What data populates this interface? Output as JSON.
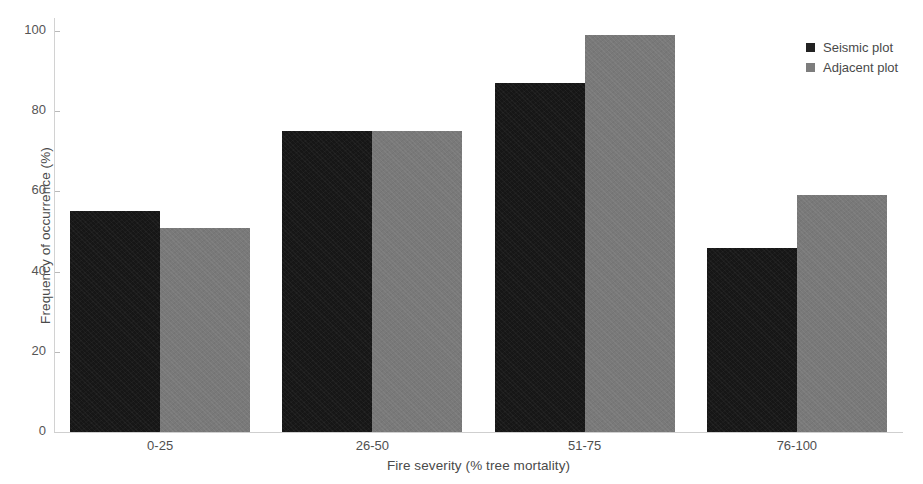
{
  "chart_data": {
    "type": "bar",
    "title": "",
    "xlabel": "Fire severity (% tree mortality)",
    "ylabel": "Frequency of occurrence (%)",
    "categories": [
      "0-25",
      "26-50",
      "51-75",
      "76-100"
    ],
    "series": [
      {
        "name": "Seismic plot",
        "color": "#161616",
        "values": [
          55,
          75,
          87,
          46
        ]
      },
      {
        "name": "Adjacent plot",
        "color": "#797979",
        "values": [
          51,
          75,
          99,
          59
        ]
      }
    ],
    "ylim": [
      0,
      100
    ],
    "yticks": [
      0,
      20,
      40,
      60,
      80,
      100
    ],
    "ytick_labels": [
      "0",
      "20",
      "40",
      "60",
      "80",
      "100"
    ],
    "grid": false,
    "legend_position": "top-right",
    "legend": [
      "Seismic plot",
      "Adjacent plot"
    ]
  },
  "axes": {
    "y_title": "Frequency of occurrence (%)",
    "x_title": "Fire severity (% tree mortality)"
  },
  "legend": {
    "entries": [
      {
        "label": "Seismic plot"
      },
      {
        "label": "Adjacent plot"
      }
    ]
  }
}
